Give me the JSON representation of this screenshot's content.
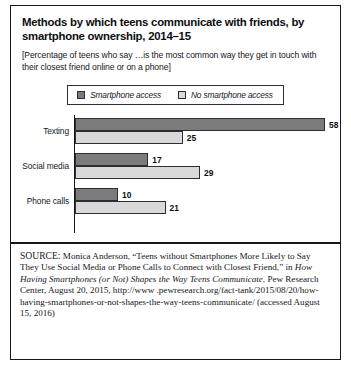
{
  "figure": {
    "title": "Methods by which teens communicate with friends, by smartphone ownership, 2014–15",
    "subtitle": "[Percentage of teens who say …is the most common way they get in touch with their closest friend online or on a phone]",
    "legend": {
      "series_1_label": "Smartphone access",
      "series_2_label": "No smartphone access"
    },
    "source": {
      "prefix": "SOURCE:",
      "text_part_1": " Monica Anderson, “Teens without Smartphones More Likely to Say They Use Social Media or Phone Calls to Connect with Closest Friend,” in ",
      "italic_title": "How Having Smartphones (or Not) Shapes the Way Teens Communicate",
      "text_part_2": ", Pew Research Center, August 20, 2015, http://www .pewresearch.org/fact-tank/2015/08/20/how-having-smartphones-or-not-shapes-the-way-teens-communicate/ (accessed August 15, 2016)"
    }
  },
  "chart_data": {
    "type": "bar",
    "orientation": "horizontal",
    "title": "Methods by which teens communicate with friends, by smartphone ownership, 2014–15",
    "subtitle": "[Percentage of teens who say …is the most common way they get in touch with their closest friend online or on a phone]",
    "xlabel": "",
    "ylabel": "",
    "xlim": [
      0,
      58
    ],
    "grid": false,
    "legend_position": "top-center",
    "categories": [
      "Texting",
      "Social media",
      "Phone calls"
    ],
    "series": [
      {
        "name": "Smartphone access",
        "color": "#7b7b7b",
        "values": [
          58,
          17,
          10
        ]
      },
      {
        "name": "No smartphone access",
        "color": "#d9d9d9",
        "values": [
          25,
          29,
          21
        ]
      }
    ],
    "value_labels": {
      "Texting": {
        "Smartphone access": "58",
        "No smartphone access": "25"
      },
      "Social media": {
        "Smartphone access": "17",
        "No smartphone access": "29"
      },
      "Phone calls": {
        "Smartphone access": "10",
        "No smartphone access": "21"
      }
    }
  }
}
